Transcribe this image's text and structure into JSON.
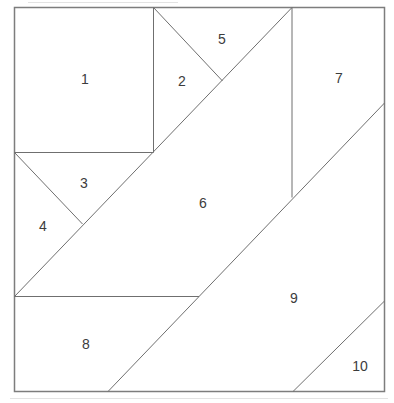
{
  "diagram": {
    "background_color": "#ffffff",
    "border_color": "#7d7d7d",
    "line_color": "#6f6f6f",
    "artifact_color": "#e3e3e3",
    "label_color": "#3c3c3c",
    "border": {
      "x": 14.5,
      "y": 7.5,
      "width": 370,
      "height": 384
    },
    "segments": [
      {
        "name": "piece1-right-edge",
        "x1": 153.5,
        "y1": 7.5,
        "x2": 153.5,
        "y2": 152.5
      },
      {
        "name": "piece1-bottom-edge",
        "x1": 14.5,
        "y1": 152.5,
        "x2": 153.5,
        "y2": 152.5
      },
      {
        "name": "long-diagonal-piece6-left",
        "x1": 14.5,
        "y1": 296.5,
        "x2": 292,
        "y2": 7.5
      },
      {
        "name": "diagonal-piece2-piece5",
        "x1": 153.5,
        "y1": 7.5,
        "x2": 222.5,
        "y2": 81
      },
      {
        "name": "diagonal-piece3-piece4",
        "x1": 14.5,
        "y1": 152.5,
        "x2": 82.5,
        "y2": 224
      },
      {
        "name": "piece6-right-edge",
        "x1": 292,
        "y1": 7.5,
        "x2": 292,
        "y2": 197.5
      },
      {
        "name": "piece8-top-edge",
        "x1": 14.5,
        "y1": 296.5,
        "x2": 199,
        "y2": 296.5
      },
      {
        "name": "long-diagonal-piece9-left",
        "x1": 384.5,
        "y1": 103,
        "x2": 108,
        "y2": 391.5
      },
      {
        "name": "diagonal-piece10",
        "x1": 384.5,
        "y1": 301,
        "x2": 293,
        "y2": 391.5
      }
    ],
    "artifacts": [
      {
        "name": "scan-artifact-top",
        "x1": 28,
        "y1": 2.5,
        "x2": 178,
        "y2": 2.5
      },
      {
        "name": "scan-artifact-bottom",
        "x1": 10,
        "y1": 398.5,
        "x2": 388,
        "y2": 398.5
      }
    ],
    "labels": [
      {
        "text": "1",
        "x": 85,
        "y": 79
      },
      {
        "text": "2",
        "x": 182,
        "y": 81
      },
      {
        "text": "3",
        "x": 84,
        "y": 183
      },
      {
        "text": "4",
        "x": 43,
        "y": 226
      },
      {
        "text": "5",
        "x": 222,
        "y": 39
      },
      {
        "text": "6",
        "x": 203,
        "y": 203
      },
      {
        "text": "7",
        "x": 339,
        "y": 78
      },
      {
        "text": "8",
        "x": 86,
        "y": 344
      },
      {
        "text": "9",
        "x": 294,
        "y": 298
      },
      {
        "text": "10",
        "x": 360,
        "y": 366
      }
    ]
  }
}
